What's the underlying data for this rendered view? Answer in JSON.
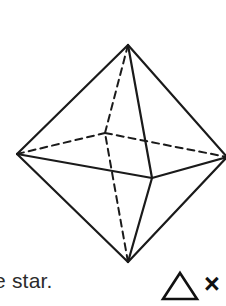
{
  "figure": {
    "name": "octahedron-wireframe",
    "stroke_color": "#1a1a1a",
    "background_color": "#ffffff",
    "solid_stroke_width": 2.2,
    "dashed_stroke_width": 2.0,
    "dash_pattern": "7,5",
    "vertices": {
      "top": {
        "label": "top-apex",
        "x": 128,
        "y": 45
      },
      "bottom": {
        "label": "bottom-apex",
        "x": 128,
        "y": 262
      },
      "left": {
        "label": "left-equator",
        "x": 17,
        "y": 154
      },
      "right": {
        "label": "right-equator",
        "x": 227,
        "y": 157
      },
      "front": {
        "label": "front-equator",
        "x": 152,
        "y": 178
      },
      "back": {
        "label": "back-equator-hidden",
        "x": 105,
        "y": 133
      }
    },
    "solid_edges": [
      {
        "name": "top-to-left",
        "x1": 128,
        "y1": 45,
        "x2": 17,
        "y2": 154
      },
      {
        "name": "top-to-right",
        "x1": 128,
        "y1": 45,
        "x2": 227,
        "y2": 157
      },
      {
        "name": "top-to-front",
        "x1": 128,
        "y1": 45,
        "x2": 152,
        "y2": 178
      },
      {
        "name": "bottom-to-left",
        "x1": 128,
        "y1": 262,
        "x2": 17,
        "y2": 154
      },
      {
        "name": "bottom-to-right",
        "x1": 128,
        "y1": 262,
        "x2": 227,
        "y2": 157
      },
      {
        "name": "bottom-to-front",
        "x1": 128,
        "y1": 262,
        "x2": 152,
        "y2": 178
      },
      {
        "name": "left-to-front",
        "x1": 17,
        "y1": 154,
        "x2": 152,
        "y2": 178
      },
      {
        "name": "front-to-right",
        "x1": 152,
        "y1": 178,
        "x2": 227,
        "y2": 157
      }
    ],
    "dashed_edges": [
      {
        "name": "top-to-back-hidden",
        "x1": 128,
        "y1": 45,
        "x2": 105,
        "y2": 133
      },
      {
        "name": "bottom-to-back-hidden",
        "x1": 128,
        "y1": 262,
        "x2": 105,
        "y2": 133
      },
      {
        "name": "left-to-back-hidden",
        "x1": 17,
        "y1": 154,
        "x2": 105,
        "y2": 133
      },
      {
        "name": "back-to-right-hidden",
        "x1": 105,
        "y1": 133,
        "x2": 227,
        "y2": 157
      }
    ]
  },
  "caption": {
    "text": "e star."
  },
  "symbols": {
    "triangle": {
      "name": "triangle-outline",
      "glyph": "triangle",
      "stroke_color": "#111111"
    },
    "times": {
      "name": "multiplication-sign",
      "glyph": "×"
    }
  }
}
